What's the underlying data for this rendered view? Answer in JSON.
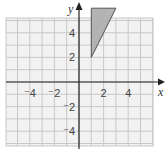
{
  "diagram": {
    "type": "coordinate-grid",
    "axes": {
      "x_label": "x",
      "y_label": "y"
    },
    "x_ticks": [
      "-4",
      "-2",
      "2",
      "4"
    ],
    "y_ticks": [
      "4",
      "2",
      "-2",
      "-4"
    ],
    "range": {
      "x": [
        -6,
        6
      ],
      "y": [
        -5,
        5.5
      ]
    },
    "shape": {
      "type": "triangle",
      "vertices": [
        [
          1,
          2
        ],
        [
          1,
          6
        ],
        [
          3,
          6
        ]
      ],
      "fill": "#b3b3b3",
      "stroke": "#555555"
    },
    "colors": {
      "grid": "#c8c8c8",
      "axis": "#222222",
      "background": "#f2f2f2"
    }
  }
}
